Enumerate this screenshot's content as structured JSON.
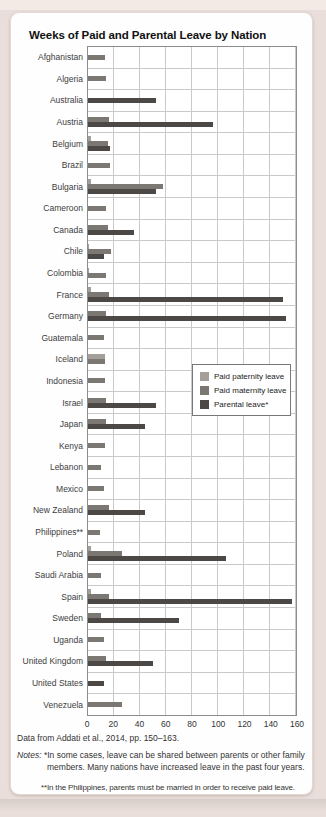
{
  "figure": {
    "title": "Weeks of Paid and Parental Leave by Nation",
    "source": "Data from Addati et al., 2014, pp. 150–163.",
    "notes_label": "Notes:",
    "note1": "*In some cases, leave can be shared between parents or other family members. Many nations have increased leave in the past four years.",
    "note2": "**In the Philippines, parents must be married in order to receive paid leave."
  },
  "colors": {
    "page_background": "#e9deda",
    "card_background": "#fefefe",
    "grid_line": "#c9c9c9",
    "axis_border": "#8c8c8c",
    "paternity_bar": "#a49f9a",
    "maternity_bar": "#7b7773",
    "parental_bar": "#4c4845"
  },
  "chart_data": {
    "type": "bar",
    "orientation": "horizontal",
    "title": "Weeks of Paid and Parental Leave by Nation",
    "xlabel": "",
    "ylabel": "",
    "xlim": [
      0,
      160
    ],
    "xticks": [
      0,
      20,
      40,
      60,
      80,
      100,
      120,
      140,
      160
    ],
    "grid": true,
    "legend_position": "middle-right",
    "categories": [
      "Afghanistan",
      "Algeria",
      "Australia",
      "Austria",
      "Belgium",
      "Brazil",
      "Bulgaria",
      "Cameroon",
      "Canada",
      "Chile",
      "Colombia",
      "France",
      "Germany",
      "Guatemala",
      "Iceland",
      "Indonesia",
      "Israel",
      "Japan",
      "Kenya",
      "Lebanon",
      "Mexico",
      "New Zealand",
      "Philippines**",
      "Poland",
      "Saudi Arabia",
      "Spain",
      "Sweden",
      "Uganda",
      "United Kingdom",
      "United States",
      "Venezuela"
    ],
    "series": [
      {
        "name": "Paid paternity leave",
        "key": "paternity",
        "color": "#a49f9a",
        "values": [
          0,
          0,
          0,
          0,
          2,
          0,
          2,
          0,
          0,
          1,
          1,
          2,
          0,
          0,
          13,
          0,
          0,
          0,
          0,
          0,
          0,
          0,
          0,
          2,
          0,
          2,
          0,
          0,
          0,
          0,
          0
        ]
      },
      {
        "name": "Paid maternity leave",
        "key": "maternity",
        "color": "#7b7773",
        "values": [
          13,
          14,
          0,
          16,
          15,
          17,
          58,
          14,
          15,
          18,
          14,
          16,
          14,
          12,
          13,
          13,
          14,
          14,
          13,
          10,
          12,
          16,
          9,
          26,
          10,
          16,
          10,
          12,
          14,
          0,
          26
        ]
      },
      {
        "name": "Parental leave*",
        "key": "parental",
        "color": "#4c4845",
        "values": [
          0,
          0,
          52,
          96,
          17,
          0,
          52,
          0,
          35,
          12,
          0,
          150,
          152,
          0,
          0,
          0,
          52,
          44,
          0,
          0,
          0,
          44,
          0,
          106,
          0,
          157,
          70,
          0,
          50,
          12,
          0
        ]
      }
    ]
  }
}
